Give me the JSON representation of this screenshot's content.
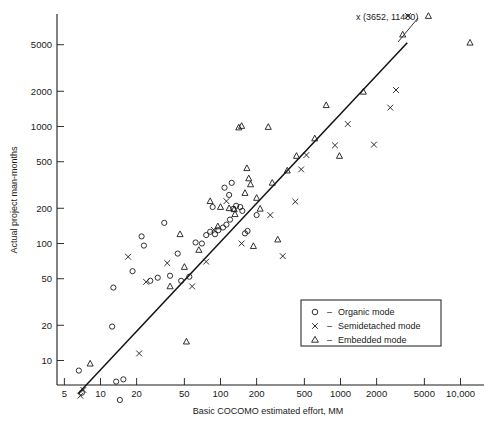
{
  "chart_data": {
    "type": "scatter",
    "title": "",
    "xlabel": "Basic COCOMO estimated effort, MM",
    "ylabel": "Actual project man-months",
    "xscale": "log",
    "yscale": "log",
    "xlim": [
      4.2,
      16000
    ],
    "ylim": [
      4.0,
      9000
    ],
    "grid": false,
    "legend_position": "inside-lower-right",
    "xticks": [
      5,
      10,
      20,
      50,
      100,
      200,
      500,
      1000,
      2000,
      5000,
      10000
    ],
    "xticklabels": [
      "5",
      "10",
      "20",
      "50",
      "100",
      "200",
      "500",
      "1000",
      "2000",
      "5000",
      "10,000"
    ],
    "yticks": [
      10,
      20,
      50,
      100,
      200,
      500,
      1000,
      2000,
      5000
    ],
    "yticklabels": [
      "10",
      "20",
      "50",
      "100",
      "200",
      "500",
      "1000",
      "2000",
      "5000"
    ],
    "annotations": [
      {
        "text": "x (3652, 11400)",
        "x": 3652,
        "y": 11400,
        "leader": true
      }
    ],
    "reference_line": {
      "label": "estimate = actual",
      "from": [
        6.5,
        5.2
      ],
      "to": [
        3600,
        5200
      ]
    },
    "series": [
      {
        "name": "Organic mode",
        "marker": "circle",
        "points": [
          [
            6.6,
            8.2
          ],
          [
            7.0,
            5.3
          ],
          [
            13.5,
            6.6
          ],
          [
            15.5,
            6.9
          ],
          [
            14.5,
            4.6
          ],
          [
            12.5,
            19.5
          ],
          [
            12.8,
            42
          ],
          [
            18.5,
            58
          ],
          [
            22,
            115
          ],
          [
            23,
            96
          ],
          [
            26,
            48
          ],
          [
            30,
            51
          ],
          [
            34,
            150
          ],
          [
            38,
            53
          ],
          [
            44,
            82
          ],
          [
            47,
            48
          ],
          [
            55,
            52
          ],
          [
            62,
            102
          ],
          [
            70,
            100
          ],
          [
            76,
            118
          ],
          [
            82,
            126
          ],
          [
            90,
            120
          ],
          [
            96,
            130
          ],
          [
            105,
            137
          ],
          [
            112,
            145
          ],
          [
            120,
            160
          ],
          [
            128,
            198
          ],
          [
            135,
            210
          ],
          [
            146,
            205
          ],
          [
            152,
            190
          ],
          [
            118,
            260
          ],
          [
            108,
            300
          ],
          [
            124,
            330
          ],
          [
            160,
            122
          ],
          [
            168,
            128
          ],
          [
            200,
            175
          ],
          [
            86,
            205
          ]
        ]
      },
      {
        "name": "Semidetached mode",
        "marker": "x",
        "points": [
          [
            6.8,
            5.0
          ],
          [
            7.2,
            5.6
          ],
          [
            17,
            77
          ],
          [
            21,
            11.5
          ],
          [
            24,
            47
          ],
          [
            36,
            68
          ],
          [
            58,
            43
          ],
          [
            76,
            70
          ],
          [
            88,
            131
          ],
          [
            112,
            230
          ],
          [
            150,
            100
          ],
          [
            260,
            175
          ],
          [
            330,
            78
          ],
          [
            420,
            228
          ],
          [
            470,
            430
          ],
          [
            520,
            570
          ],
          [
            900,
            690
          ],
          [
            1150,
            1050
          ],
          [
            1900,
            700
          ],
          [
            2600,
            1450
          ],
          [
            2900,
            2050
          ],
          [
            3652,
            11400
          ]
        ]
      },
      {
        "name": "Embedded mode",
        "marker": "triangle",
        "points": [
          [
            8.2,
            9.4
          ],
          [
            38,
            43
          ],
          [
            52,
            14.5
          ],
          [
            46,
            120
          ],
          [
            50,
            63
          ],
          [
            66,
            88
          ],
          [
            82,
            230
          ],
          [
            95,
            140
          ],
          [
            100,
            205
          ],
          [
            118,
            200
          ],
          [
            130,
            196
          ],
          [
            132,
            178
          ],
          [
            142,
            980
          ],
          [
            150,
            1010
          ],
          [
            160,
            270
          ],
          [
            166,
            440
          ],
          [
            172,
            360
          ],
          [
            178,
            320
          ],
          [
            188,
            95
          ],
          [
            200,
            245
          ],
          [
            214,
            198
          ],
          [
            250,
            990
          ],
          [
            270,
            330
          ],
          [
            300,
            108
          ],
          [
            360,
            420
          ],
          [
            430,
            560
          ],
          [
            610,
            790
          ],
          [
            760,
            1520
          ],
          [
            980,
            560
          ],
          [
            1550,
            1980
          ],
          [
            3300,
            6100
          ],
          [
            5400,
            9200
          ],
          [
            12000,
            5200
          ]
        ]
      }
    ]
  },
  "legend": {
    "entries": [
      {
        "symbol": "o",
        "dash": "–",
        "label": "Organic mode"
      },
      {
        "symbol": "x",
        "dash": "–",
        "label": "Semidetached mode"
      },
      {
        "symbol": "△",
        "dash": "–",
        "label": "Embedded mode"
      }
    ]
  },
  "axes": {
    "x_title": "Basic COCOMO estimated effort, MM",
    "y_title": "Actual project man-months"
  },
  "annotation": {
    "text": "x (3652, 11400)"
  }
}
